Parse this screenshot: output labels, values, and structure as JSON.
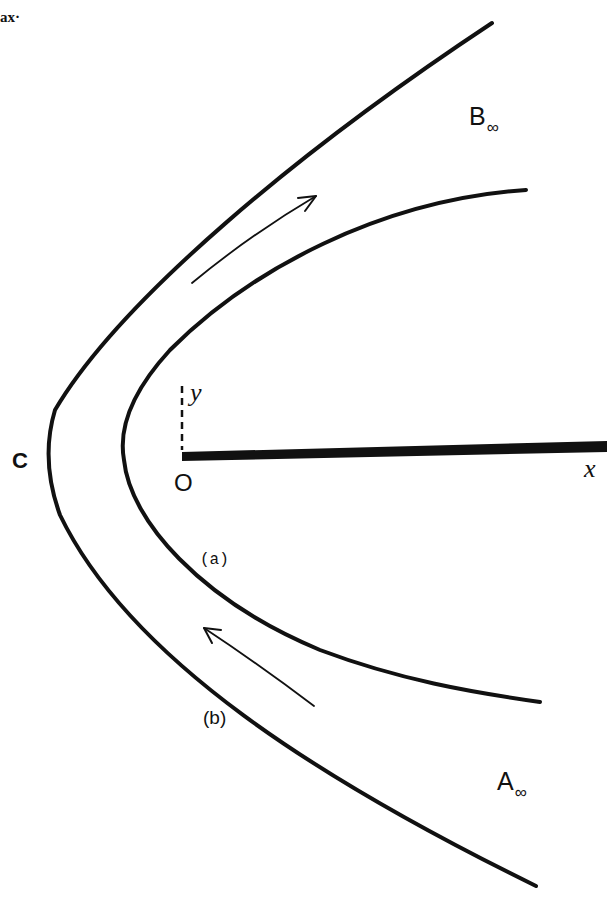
{
  "header_fragment": "ax·",
  "labels": {
    "b_infinity": {
      "letter": "B",
      "subscript": "∞"
    },
    "a_infinity": {
      "letter": "A",
      "subscript": "∞"
    },
    "c_point": "C",
    "origin": "O",
    "y_axis": "y",
    "x_axis": "x",
    "streamline_a": "(a)",
    "streamline_b": "(b)"
  },
  "colors": {
    "ink": "#111111",
    "background": "#ffffff"
  },
  "elements": {
    "outer_streamline": {
      "label": "(b)",
      "vertex": [
        48,
        460
      ],
      "top_end": [
        492,
        23
      ],
      "bottom_end": [
        536,
        886
      ]
    },
    "inner_streamline": {
      "label": "(a)",
      "vertex": [
        124,
        460
      ],
      "top_end": [
        526,
        190
      ],
      "bottom_end": [
        540,
        702
      ]
    },
    "flow_arrow_upper": {
      "direction": "up-right",
      "from": [
        192,
        283
      ],
      "to": [
        316,
        196
      ]
    },
    "flow_arrow_lower": {
      "direction": "up-left",
      "from": [
        314,
        706
      ],
      "to": [
        204,
        628
      ]
    },
    "flat_plate": {
      "from": [
        182,
        456
      ],
      "to": [
        607,
        446
      ]
    }
  }
}
